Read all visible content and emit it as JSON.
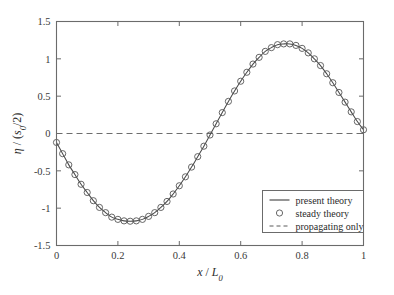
{
  "chart_data": {
    "type": "line",
    "title": "",
    "xlabel": "x / L_0",
    "ylabel": "η / (s_0/2)",
    "xlabel_parts": {
      "var": "x",
      "slash": " / ",
      "den": "L",
      "den_sub": "0"
    },
    "ylabel_parts": {
      "var": "η",
      "slash": " / (",
      "den": "s",
      "den_sub": "0",
      "tail": "/2)"
    },
    "xlim": [
      0,
      1
    ],
    "ylim": [
      -1.5,
      1.5
    ],
    "xticks": [
      0,
      0.2,
      0.4,
      0.6,
      0.8,
      1
    ],
    "xticklabels": [
      "0",
      "0.2",
      "0.4",
      "0.6",
      "0.8",
      "1"
    ],
    "yticks": [
      -1.5,
      -1,
      -0.5,
      0,
      0.5,
      1,
      1.5
    ],
    "yticklabels": [
      "-1.5",
      "-1",
      "-0.5",
      "0",
      "0.5",
      "1",
      "1.5"
    ],
    "grid": false,
    "legend_position": "lower-right",
    "series": [
      {
        "name": "present theory",
        "style": "solid-line",
        "color": "#4a4a4a",
        "x": [
          0.0,
          0.02,
          0.04,
          0.06,
          0.08,
          0.1,
          0.12,
          0.14,
          0.16,
          0.18,
          0.2,
          0.22,
          0.24,
          0.26,
          0.28,
          0.3,
          0.32,
          0.34,
          0.36,
          0.38,
          0.4,
          0.42,
          0.44,
          0.46,
          0.48,
          0.5,
          0.52,
          0.54,
          0.56,
          0.58,
          0.6,
          0.62,
          0.64,
          0.66,
          0.68,
          0.7,
          0.72,
          0.74,
          0.76,
          0.78,
          0.8,
          0.82,
          0.84,
          0.86,
          0.88,
          0.9,
          0.92,
          0.94,
          0.96,
          0.98,
          1.0
        ],
        "y": [
          -0.12,
          -0.27,
          -0.42,
          -0.55,
          -0.68,
          -0.79,
          -0.9,
          -0.99,
          -1.06,
          -1.12,
          -1.15,
          -1.17,
          -1.175,
          -1.17,
          -1.15,
          -1.11,
          -1.06,
          -0.99,
          -0.91,
          -0.81,
          -0.7,
          -0.58,
          -0.45,
          -0.31,
          -0.17,
          -0.02,
          0.13,
          0.28,
          0.43,
          0.57,
          0.7,
          0.82,
          0.93,
          1.02,
          1.1,
          1.15,
          1.19,
          1.2,
          1.2,
          1.18,
          1.14,
          1.08,
          1.0,
          0.91,
          0.8,
          0.68,
          0.55,
          0.42,
          0.29,
          0.16,
          0.05
        ]
      },
      {
        "name": "steady theory",
        "style": "open-circle-markers",
        "color": "#555555",
        "x": [
          0.0,
          0.02,
          0.04,
          0.06,
          0.08,
          0.1,
          0.12,
          0.14,
          0.16,
          0.18,
          0.2,
          0.22,
          0.24,
          0.26,
          0.28,
          0.3,
          0.32,
          0.34,
          0.36,
          0.38,
          0.4,
          0.42,
          0.44,
          0.46,
          0.48,
          0.5,
          0.52,
          0.54,
          0.56,
          0.58,
          0.6,
          0.62,
          0.64,
          0.66,
          0.68,
          0.7,
          0.72,
          0.74,
          0.76,
          0.78,
          0.8,
          0.82,
          0.84,
          0.86,
          0.88,
          0.9,
          0.92,
          0.94,
          0.96,
          0.98,
          1.0
        ],
        "y": [
          -0.12,
          -0.27,
          -0.42,
          -0.55,
          -0.68,
          -0.79,
          -0.9,
          -0.99,
          -1.06,
          -1.12,
          -1.15,
          -1.17,
          -1.175,
          -1.17,
          -1.15,
          -1.11,
          -1.06,
          -0.99,
          -0.91,
          -0.81,
          -0.7,
          -0.58,
          -0.45,
          -0.31,
          -0.17,
          -0.02,
          0.13,
          0.28,
          0.43,
          0.57,
          0.7,
          0.82,
          0.93,
          1.02,
          1.1,
          1.15,
          1.19,
          1.2,
          1.2,
          1.18,
          1.14,
          1.08,
          1.0,
          0.91,
          0.8,
          0.68,
          0.55,
          0.42,
          0.29,
          0.16,
          0.05
        ]
      },
      {
        "name": "propagating only",
        "style": "dashed-line",
        "color": "#6d6d6d",
        "x": [
          0,
          1
        ],
        "y": [
          0,
          0
        ]
      }
    ],
    "annotations": []
  },
  "legend": {
    "items": [
      {
        "label": "present theory",
        "marker": "solid-line"
      },
      {
        "label": "steady theory",
        "marker": "open-circle"
      },
      {
        "label": "propagating only",
        "marker": "dashed-line"
      }
    ]
  }
}
